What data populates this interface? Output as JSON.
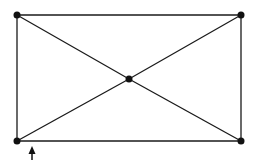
{
  "diagram": {
    "type": "graph",
    "stroke_color": "#1a1a1a",
    "node_color": "#111111",
    "nodes": [
      {
        "id": "top-left",
        "x": 17,
        "y": 15
      },
      {
        "id": "top-right",
        "x": 241,
        "y": 15
      },
      {
        "id": "center",
        "x": 129,
        "y": 79
      },
      {
        "id": "bottom-left",
        "x": 17,
        "y": 141
      },
      {
        "id": "bottom-right",
        "x": 241,
        "y": 141
      }
    ],
    "edges": [
      [
        "top-left",
        "top-right"
      ],
      [
        "top-right",
        "bottom-right"
      ],
      [
        "bottom-right",
        "bottom-left"
      ],
      [
        "bottom-left",
        "top-left"
      ],
      [
        "top-left",
        "center"
      ],
      [
        "center",
        "bottom-right"
      ],
      [
        "top-right",
        "center"
      ],
      [
        "center",
        "bottom-left"
      ]
    ],
    "arrow": {
      "direction": "up",
      "x": 32,
      "y_tip": 147,
      "y_tail": 160
    }
  }
}
